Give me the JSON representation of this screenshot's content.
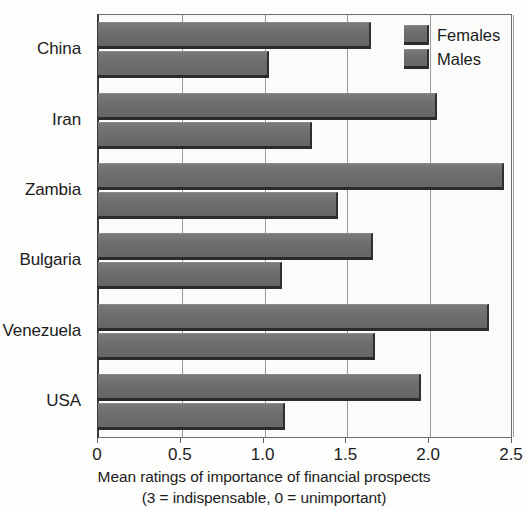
{
  "chart_data": {
    "type": "bar",
    "orientation": "horizontal",
    "title": "",
    "xlabel": "Mean ratings of importance of financial prospects",
    "xlabel_line2": "(3 = indispensable, 0 = unimportant)",
    "ylabel": "",
    "categories": [
      "China",
      "Iran",
      "Zambia",
      "Bulgaria",
      "Venezuela",
      "USA"
    ],
    "series": [
      {
        "name": "Females",
        "values": [
          1.65,
          2.05,
          2.45,
          1.66,
          2.36,
          1.95
        ]
      },
      {
        "name": "Males",
        "values": [
          1.03,
          1.29,
          1.45,
          1.11,
          1.67,
          1.13
        ]
      }
    ],
    "xlim": [
      0,
      2.5
    ],
    "xticks": [
      0,
      0.5,
      1.0,
      1.5,
      2.0,
      2.5
    ],
    "xticklabels": [
      "0",
      "0.5",
      "1.0",
      "1.5",
      "2.0",
      "2.5"
    ],
    "grid": "vertical",
    "legend_position": "top-right",
    "colors": {
      "bar_fill": "#6f6f6f",
      "bar_shadow": "#2b2b2b",
      "plot_background": "#fbfbfa",
      "gridline": "#9a9a9a",
      "axis": "#3a3a3a",
      "text": "#1c1c1c"
    }
  },
  "legend": {
    "items": [
      {
        "label": "Females"
      },
      {
        "label": "Males"
      }
    ]
  }
}
